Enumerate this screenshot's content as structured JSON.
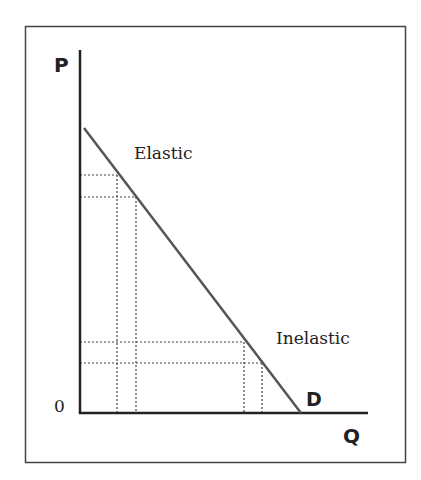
{
  "diagram": {
    "axes": {
      "y_label": "P",
      "x_label": "Q",
      "origin_label": "0"
    },
    "curve": {
      "label": "D",
      "start": [
        84,
        128
      ],
      "end": [
        301,
        413
      ]
    },
    "regions": {
      "upper_label": "Elastic",
      "lower_label": "Inelastic"
    },
    "guides": {
      "upper_prices_y": [
        175,
        197
      ],
      "upper_quantities_x": [
        117,
        136
      ],
      "lower_prices_y": [
        342,
        363
      ],
      "lower_quantities_x": [
        244,
        262
      ]
    },
    "colors": {
      "line": "#555555",
      "axis": "#222222",
      "frame": "#444444",
      "text": "#222222"
    }
  }
}
